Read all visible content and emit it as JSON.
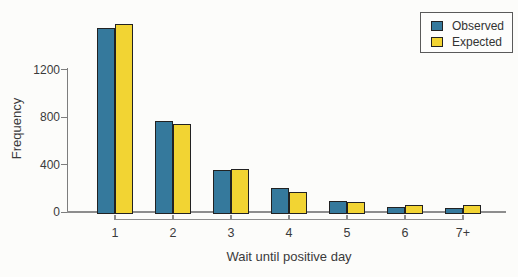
{
  "chart_data": {
    "type": "bar",
    "title": "",
    "xlabel": "Wait until positive day",
    "ylabel": "Frequency",
    "categories": [
      "1",
      "2",
      "3",
      "4",
      "5",
      "6",
      "7+"
    ],
    "series": [
      {
        "name": "Observed",
        "color": "#35799c",
        "values": [
          1550,
          770,
          350,
          200,
          95,
          45,
          30
        ]
      },
      {
        "name": "Expected",
        "color": "#f2d433",
        "values": [
          1585,
          745,
          360,
          170,
          85,
          60,
          60
        ]
      }
    ],
    "y_ticks": [
      0,
      400,
      800,
      1200
    ],
    "ylim": [
      0,
      1640
    ],
    "grid": false,
    "legend_position": "top-right",
    "bar_outline_color": "#222222",
    "axis_color": "#8d8d8d",
    "text_color": "#3a3a3a"
  }
}
